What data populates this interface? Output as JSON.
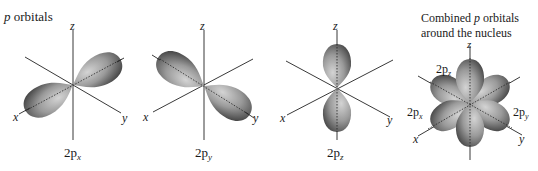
{
  "figure": {
    "title_prefix": "p",
    "title_suffix": " orbitals",
    "combined_title_line1_a": "Combined ",
    "combined_title_line1_b": "p",
    "combined_title_line1_c": " orbitals",
    "combined_title_line2": "around the nucleus"
  },
  "panels": [
    {
      "id": "2px",
      "caption_main": "2p",
      "caption_sub": "x",
      "lobe_axis": "x"
    },
    {
      "id": "2py",
      "caption_main": "2p",
      "caption_sub": "y",
      "lobe_axis": "y"
    },
    {
      "id": "2pz",
      "caption_main": "2p",
      "caption_sub": "z",
      "lobe_axis": "z"
    },
    {
      "id": "combined",
      "labels": [
        {
          "main": "2p",
          "sub": "z"
        },
        {
          "main": "2p",
          "sub": "x"
        },
        {
          "main": "2p",
          "sub": "y"
        }
      ]
    }
  ],
  "axes": {
    "x": "x",
    "y": "y",
    "z": "z"
  },
  "colors": {
    "lobe_light": "#c8c8c8",
    "lobe_mid": "#8a8a8a",
    "lobe_dark": "#3c3c3c",
    "axis": "#222222",
    "text": "#1a1a1a"
  }
}
